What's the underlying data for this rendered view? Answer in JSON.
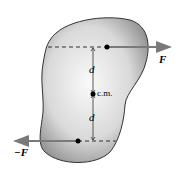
{
  "diagram": {
    "labels": {
      "force": "F",
      "neg_force": "−F",
      "dist_top": "d",
      "dist_bottom": "d",
      "center": "c.m."
    },
    "colors": {
      "body_fill": "#c8c8c8",
      "body_outline": "#333333",
      "arrow": "#7a7a7a",
      "dashed": "#333333",
      "dot": "#000000"
    }
  }
}
